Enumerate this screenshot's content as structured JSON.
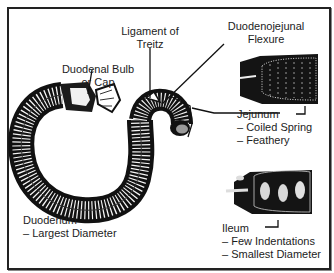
{
  "diagram": {
    "labels": {
      "ligament": {
        "line1": "Ligament of",
        "line2": "Treitz"
      },
      "flexure": {
        "line1": "Duodenojejunal",
        "line2": "Flexure"
      },
      "bulb": {
        "line1": "Duodenal Bulb",
        "line2": "or Cap"
      },
      "jejunum": {
        "title": "Jejunum",
        "note1": "– Coiled Spring",
        "note2": "– Feathery"
      },
      "duodenum": {
        "title": "Duodenum",
        "note1": "– Largest Diameter"
      },
      "ileum": {
        "title": "Ileum",
        "note1": "– Few Indentations",
        "note2": "– Smallest Diameter"
      }
    },
    "colors": {
      "ink": "#1a1a1a",
      "paper": "#ffffff",
      "border": "#222222"
    }
  }
}
